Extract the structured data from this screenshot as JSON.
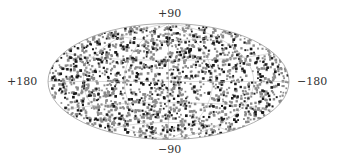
{
  "chart_data": {
    "type": "scatter",
    "projection": "hammer-aitoff",
    "title": "",
    "xlabel": "",
    "ylabel": "",
    "axis_labels": {
      "top": "+90",
      "bottom": "−90",
      "left": "+180",
      "right": "−180"
    },
    "longitude_range": [
      180,
      -180
    ],
    "latitude_range": [
      -90,
      90
    ],
    "grid": true,
    "grid_meridians_deg": [
      -120,
      -60,
      0,
      60,
      120
    ],
    "grid_parallels_deg": [
      -60,
      -30,
      0,
      30,
      60
    ],
    "series": [
      {
        "name": "gray-points",
        "color": "#8a8a8a",
        "approx_count": 1400,
        "distribution": "uniform on sphere"
      },
      {
        "name": "black-points",
        "color": "#1a1a1a",
        "approx_count": 500,
        "distribution": "uniform on sphere"
      }
    ],
    "legend": null
  },
  "layout": {
    "center_x": 168.5,
    "center_y": 81.5,
    "semi_axis_x": 120.5,
    "semi_axis_y": 58,
    "outline_color": "#9a9a9a",
    "grid_color": "#b5b5b5",
    "seed": 7
  }
}
